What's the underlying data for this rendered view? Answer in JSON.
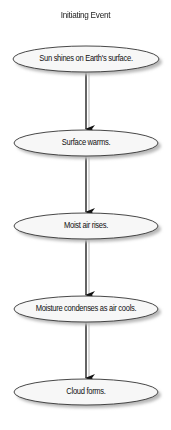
{
  "diagram": {
    "title": "Initiating Event",
    "colors": {
      "node_fill": "#f7f7f7",
      "node_stroke": "#333333",
      "shadow": "#bdbdbd",
      "arrow": "#111111"
    },
    "nodes": [
      {
        "id": "n1",
        "label": "Sun shines on Earth's surface.",
        "cx": 86,
        "cy": 59,
        "rx": 73,
        "ry": 13
      },
      {
        "id": "n2",
        "label": "Surface warms.",
        "cx": 86,
        "cy": 143,
        "rx": 72,
        "ry": 13
      },
      {
        "id": "n3",
        "label": "Moist air rises.",
        "cx": 86,
        "cy": 226,
        "rx": 72,
        "ry": 13
      },
      {
        "id": "n4",
        "label": "Moisture condenses as air cools.",
        "cx": 86,
        "cy": 309,
        "rx": 72,
        "ry": 13
      },
      {
        "id": "n5",
        "label": "Cloud forms.",
        "cx": 86,
        "cy": 392,
        "rx": 72,
        "ry": 13
      }
    ],
    "edges": [
      {
        "from": "n1",
        "to": "n2"
      },
      {
        "from": "n2",
        "to": "n3"
      },
      {
        "from": "n3",
        "to": "n4"
      },
      {
        "from": "n4",
        "to": "n5"
      }
    ]
  }
}
